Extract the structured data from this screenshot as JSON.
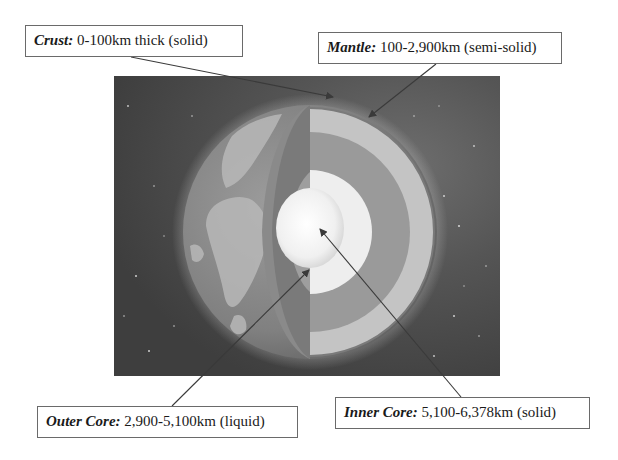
{
  "diagram": {
    "labels": [
      {
        "id": "crust",
        "term": "Crust:",
        "description": " 0-100km thick (solid)"
      },
      {
        "id": "mantle",
        "term": "Mantle:",
        "description": " 100-2,900km (semi-solid)"
      },
      {
        "id": "outer_core",
        "term": "Outer Core:",
        "description": " 2,900-5,100km (liquid)"
      },
      {
        "id": "inner_core",
        "term": "Inner Core:",
        "description": " 5,100-6,378km (solid)"
      }
    ],
    "colors": {
      "label_border": "#6a6a6a",
      "label_text": "#1a1a1a",
      "arrow": "#3a3a3a",
      "space": "#4a4a4a",
      "mantle_cut": "#c8c8c8",
      "outer_core_cut": "#9a9a9a",
      "inner_core": "#f4f4f4"
    }
  }
}
